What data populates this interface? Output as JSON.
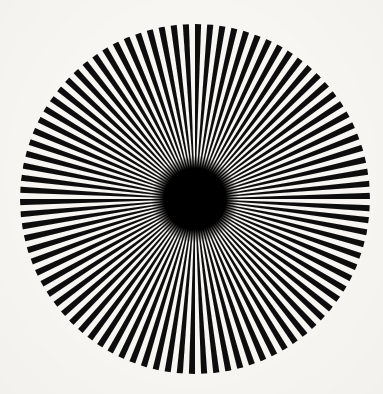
{
  "image": {
    "title": "Radial starburst optical pattern",
    "kind": "siemens-star",
    "width": 383,
    "height": 394,
    "background_color": "#f7f6f3",
    "ray_color": "#0d0c0c",
    "gap_color": "#f7f6f3",
    "core_color": "#000000"
  },
  "figure": {
    "center_x": 195,
    "center_y": 199,
    "radius": 175,
    "ray_count": 90,
    "segment_count": 180,
    "segment_angle_deg": 2,
    "start_angle_deg": 0,
    "core_radius": 31,
    "core_fade_radius": 44,
    "edge_softness": 1.1
  },
  "labels": {
    "figure_caption": "",
    "annotation": ""
  }
}
